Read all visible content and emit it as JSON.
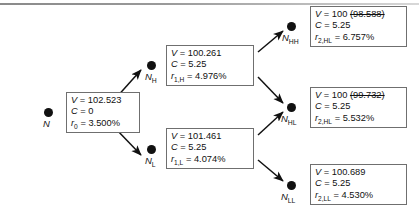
{
  "diagram": {
    "nodes": [
      {
        "id": "root",
        "label": "N",
        "label_sub": "",
        "box": {
          "value_prefix": "V",
          "value": "102.523",
          "value_struck": "",
          "coupon_prefix": "C",
          "coupon": "0",
          "rate_symbol": "r",
          "rate_sub": "0",
          "rate": "3.500%"
        }
      },
      {
        "id": "nh",
        "label": "N",
        "label_sub": "H",
        "box": {
          "value_prefix": "V",
          "value": "100.261",
          "value_struck": "",
          "coupon_prefix": "C",
          "coupon": "5.25",
          "rate_symbol": "r",
          "rate_sub": "1,H",
          "rate": "4.976%"
        }
      },
      {
        "id": "nl",
        "label": "N",
        "label_sub": "L",
        "box": {
          "value_prefix": "V",
          "value": "101.461",
          "value_struck": "",
          "coupon_prefix": "C",
          "coupon": "5.25",
          "rate_symbol": "r",
          "rate_sub": "1,L",
          "rate": "4.074%"
        }
      },
      {
        "id": "nhh",
        "label": "N",
        "label_sub": "HH",
        "box": {
          "value_prefix": "V",
          "value": "100",
          "value_struck": "(98.588)",
          "coupon_prefix": "C",
          "coupon": "5.25",
          "rate_symbol": "r",
          "rate_sub": "2,HL",
          "rate": "6.757%"
        }
      },
      {
        "id": "nhl",
        "label": "N",
        "label_sub": "HL",
        "box": {
          "value_prefix": "V",
          "value": "100",
          "value_struck": "(99.732)",
          "coupon_prefix": "C",
          "coupon": "5.25",
          "rate_symbol": "r",
          "rate_sub": "2,HL",
          "rate": "5.532%"
        }
      },
      {
        "id": "nll",
        "label": "N",
        "label_sub": "LL",
        "box": {
          "value_prefix": "V",
          "value": "100.689",
          "value_struck": "",
          "coupon_prefix": "C",
          "coupon": "5.25",
          "rate_symbol": "r",
          "rate_sub": "2,LL",
          "rate": "4.530%"
        }
      }
    ],
    "equals": "=",
    "colors": {
      "node_fill": "#111111",
      "box_border": "#6f6f6f",
      "edge": "#111111",
      "background": "#ffffff"
    }
  }
}
